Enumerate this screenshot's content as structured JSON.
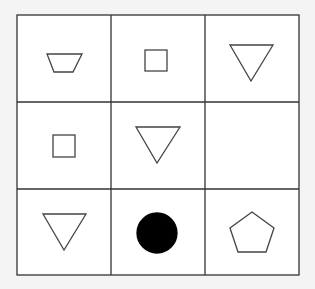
{
  "puzzle": {
    "type": "3x3 figure matrix",
    "colors": {
      "background": "#f4f4f4",
      "cell": "#ffffff",
      "line": "#333333",
      "fill": "#000000"
    },
    "cells": [
      {
        "row": 1,
        "col": 1,
        "shape": "trapezoid-inverted",
        "filled": false
      },
      {
        "row": 1,
        "col": 2,
        "shape": "square",
        "filled": false
      },
      {
        "row": 1,
        "col": 3,
        "shape": "triangle-down",
        "filled": false
      },
      {
        "row": 2,
        "col": 1,
        "shape": "square",
        "filled": false
      },
      {
        "row": 2,
        "col": 2,
        "shape": "triangle-down",
        "filled": false
      },
      {
        "row": 2,
        "col": 3,
        "shape": "empty",
        "filled": false
      },
      {
        "row": 3,
        "col": 1,
        "shape": "triangle-down",
        "filled": false
      },
      {
        "row": 3,
        "col": 2,
        "shape": "circle",
        "filled": true
      },
      {
        "row": 3,
        "col": 3,
        "shape": "pentagon",
        "filled": false
      }
    ]
  }
}
